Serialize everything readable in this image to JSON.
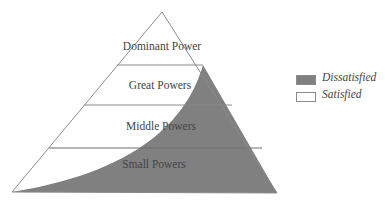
{
  "diagram": {
    "type": "power-pyramid",
    "tiers": [
      {
        "label": "Dominant Power"
      },
      {
        "label": "Great Powers"
      },
      {
        "label": "Middle Powers"
      },
      {
        "label": "Small Powers"
      }
    ],
    "legend": [
      {
        "label": "Dissatisfied",
        "color": "#808080"
      },
      {
        "label": "Satisfied",
        "color": "#ffffff"
      }
    ],
    "colors": {
      "dissatisfied": "#808080",
      "satisfied": "#ffffff",
      "outline": "#8a8a8a"
    }
  }
}
